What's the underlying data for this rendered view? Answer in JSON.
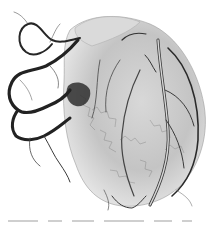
{
  "image": {
    "subject": "Cast of coronary vasculature of a heart",
    "style": "grayscale",
    "background": "#ffffff",
    "colors": {
      "vessel_dark": "#2a2a2a",
      "vessel_mid": "#6e6e6e",
      "tissue_light": "#c9c9c9",
      "tissue_lighter": "#e2e2e2"
    }
  },
  "caption": {
    "visible": "cut off at bottom edge; text not legible"
  }
}
